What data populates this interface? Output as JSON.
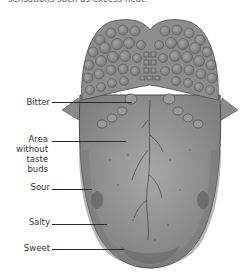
{
  "caption": "sensations such as excess heat.",
  "diagram": {
    "labels": [
      {
        "id": "bitter",
        "text": "Bitter"
      },
      {
        "id": "area",
        "text": "Area without taste buds",
        "lines": [
          "Area",
          "without",
          "taste",
          "buds"
        ]
      },
      {
        "id": "sour",
        "text": "Sour"
      },
      {
        "id": "salty",
        "text": "Salty"
      },
      {
        "id": "sweet",
        "text": "Sweet"
      }
    ]
  }
}
